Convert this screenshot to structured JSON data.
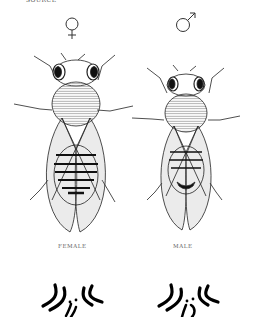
{
  "figure": {
    "cut_text": "SOURCE",
    "panels": [
      {
        "id": "female",
        "symbol": "female-symbol",
        "label": "FEMALE"
      },
      {
        "id": "male",
        "symbol": "male-symbol",
        "label": "MALE"
      }
    ],
    "colors": {
      "ink": "#1a1a1a",
      "background": "#ffffff",
      "label": "#666666"
    }
  }
}
